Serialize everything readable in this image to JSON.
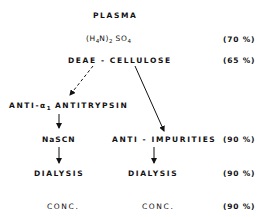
{
  "diagram": {
    "nodes": {
      "plasma": "PLASMA",
      "ammonium_sulfate": {
        "prefix": "(H",
        "sub1": "4",
        "mid": "N)",
        "sub2": "2",
        "space": " SO",
        "sub3": "4"
      },
      "deae": "DEAE - CELLULOSE",
      "anti_a1": {
        "prefix": "ANTI-α",
        "sub": "1",
        "suffix": " ANTITRYPSIN"
      },
      "nascn": "NaSCN",
      "anti_impurities": "ANTI - IMPURITIES",
      "dialysis_left": "DIALYSIS",
      "dialysis_right": "DIALYSIS",
      "conc_left": "CONC.",
      "conc_right": "CONC."
    },
    "yields": {
      "ammonium_sulfate": "(70 %)",
      "deae": "(65 %)",
      "anti_impurities": "(90 %)",
      "dialysis": "(90 %)",
      "conc": "(90 %)"
    },
    "edges": [
      {
        "from": "plasma",
        "to": "ammonium_sulfate",
        "style": "none"
      },
      {
        "from": "ammonium_sulfate",
        "to": "deae",
        "style": "none"
      },
      {
        "from": "deae",
        "to": "anti_a1",
        "style": "dashed"
      },
      {
        "from": "deae",
        "to": "anti_impurities",
        "style": "solid"
      },
      {
        "from": "anti_a1",
        "to": "nascn",
        "style": "solid"
      },
      {
        "from": "nascn",
        "to": "dialysis_left",
        "style": "solid"
      },
      {
        "from": "anti_impurities",
        "to": "dialysis_right",
        "style": "solid"
      }
    ],
    "colors": {
      "ink": "#111111",
      "background": "#ffffff"
    }
  }
}
